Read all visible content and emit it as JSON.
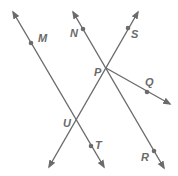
{
  "diagram": {
    "type": "geometry-lines",
    "color": "#6b6b6b",
    "lines": [
      {
        "id": "line-MT",
        "from": [
          13,
          12
        ],
        "to": [
          104,
          167
        ],
        "arrows": "both",
        "through": [
          "M",
          "U",
          "T"
        ]
      },
      {
        "id": "line-NR",
        "from": [
          73,
          12
        ],
        "to": [
          164,
          168
        ],
        "arrows": "both",
        "through": [
          "N",
          "P",
          "R"
        ]
      },
      {
        "id": "line-SU",
        "from": [
          138,
          12
        ],
        "to": [
          49,
          167
        ],
        "arrows": "both",
        "through": [
          "S",
          "P",
          "U"
        ]
      },
      {
        "id": "ray-PQ",
        "from": [
          106,
          68
        ],
        "to": [
          170,
          104
        ],
        "arrows": "end",
        "through": [
          "P",
          "Q"
        ]
      }
    ],
    "points": [
      {
        "name": "M",
        "label": "M",
        "x": 31,
        "y": 43,
        "dot": true,
        "lx": 38,
        "ly": 42
      },
      {
        "name": "N",
        "label": "N",
        "x": 83,
        "y": 29,
        "dot": true,
        "lx": 70,
        "ly": 37
      },
      {
        "name": "S",
        "label": "S",
        "x": 128,
        "y": 28,
        "dot": true,
        "lx": 131,
        "ly": 38
      },
      {
        "name": "P",
        "label": "P",
        "x": 106,
        "y": 68,
        "dot": false,
        "lx": 94,
        "ly": 76
      },
      {
        "name": "Q",
        "label": "Q",
        "x": 147,
        "y": 92,
        "dot": true,
        "lx": 145,
        "ly": 86
      },
      {
        "name": "U",
        "label": "U",
        "x": 76,
        "y": 120,
        "dot": false,
        "lx": 63,
        "ly": 127
      },
      {
        "name": "T",
        "label": "T",
        "x": 91,
        "y": 146,
        "dot": true,
        "lx": 95,
        "ly": 149
      },
      {
        "name": "R",
        "label": "R",
        "x": 154,
        "y": 151,
        "dot": true,
        "lx": 141,
        "ly": 161
      }
    ]
  }
}
